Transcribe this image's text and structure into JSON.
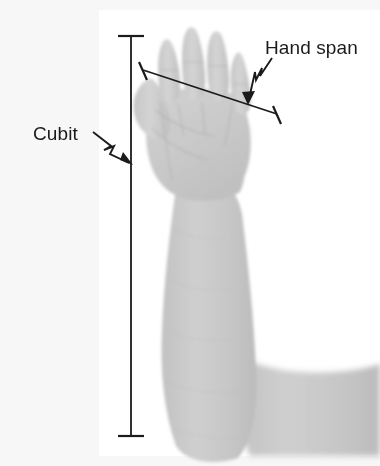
{
  "figure": {
    "background_color": "#f7f7f7",
    "panel_color": "#ffffff",
    "ink_color": "#1b1b1b",
    "skin_color": "#cbcbcb",
    "skin_shadow_color": "#bdbdbd"
  },
  "labels": {
    "cubit": "Cubit",
    "hand_span": "Hand span"
  },
  "measurements": [
    {
      "name": "cubit",
      "label": "Cubit",
      "orientation": "vertical",
      "start": {
        "x": 131,
        "y": 36
      },
      "end": {
        "x": 131,
        "y": 436
      },
      "tick_style": "t-bar",
      "leader": "zigzag-arrow",
      "leader_from": {
        "x": 93,
        "y": 133
      },
      "leader_to": {
        "x": 132,
        "y": 164
      }
    },
    {
      "name": "hand-span",
      "label": "Hand span",
      "orientation": "diagonal",
      "start": {
        "x": 143,
        "y": 70
      },
      "end": {
        "x": 277,
        "y": 114
      },
      "tick_style": "perpendicular-bar",
      "leader": "zigzag-arrow",
      "leader_from": {
        "x": 274,
        "y": 60
      },
      "leader_to": {
        "x": 248,
        "y": 103
      }
    }
  ],
  "panel": {
    "x": 99,
    "y": 10,
    "width": 281,
    "height": 446
  }
}
